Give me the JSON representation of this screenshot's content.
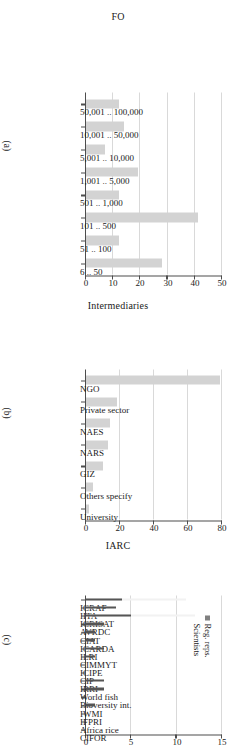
{
  "figure": {
    "orientation": "rotated-90",
    "panels": [
      "a",
      "b",
      "c"
    ]
  },
  "panel_a": {
    "tag": "(a)",
    "ylabel": "FO"
  },
  "panel_b": {
    "tag": "(b)",
    "ylabel": "Intermediaries"
  },
  "panel_c": {
    "tag": "(c)",
    "ylabel": "IARC",
    "legend": [
      {
        "label": "Reg. reps.",
        "color": "#808080"
      },
      {
        "label": "Scientists",
        "color": "#555555"
      }
    ]
  },
  "colors": {
    "bar_light": "#d3d3d3",
    "bar_dark": "#555555",
    "bar_reg_reps": "#f2f2f2",
    "grid": "#d9d9d9",
    "axis": "#4d4d4d",
    "text": "#1a1a1a"
  },
  "chart_data": [
    {
      "type": "bar",
      "id": "panel-a",
      "title": "(a)",
      "xlabel": "",
      "ylabel": "FO",
      "orientation": "vertical",
      "grid": true,
      "legend": null,
      "ylim": [
        0,
        50
      ],
      "yticks": [
        0,
        10,
        20,
        30,
        40,
        50
      ],
      "categories": [
        "50,001 .. 100,000",
        "10,001 .. 50,000",
        "5,001 .. 10,000",
        "1,001 .. 5,000",
        "501 .. 1,000",
        "101 .. 500",
        "51 .. 100",
        "6 .. 50"
      ],
      "values": [
        12,
        14,
        7,
        19,
        12,
        41,
        12,
        28
      ]
    },
    {
      "type": "bar",
      "id": "panel-b",
      "title": "(b)",
      "xlabel": "",
      "ylabel": "Intermediaries",
      "orientation": "vertical",
      "grid": true,
      "legend": null,
      "ylim": [
        0,
        80
      ],
      "yticks": [
        0,
        20,
        40,
        60,
        80
      ],
      "categories": [
        "NGO",
        "Private sector",
        "NAES",
        "NARS",
        "GIZ",
        "Others specify",
        "University"
      ],
      "values": [
        79,
        18,
        14,
        13,
        10,
        4,
        2
      ]
    },
    {
      "type": "bar",
      "id": "panel-c",
      "title": "(c)",
      "xlabel": "",
      "ylabel": "IARC",
      "orientation": "vertical",
      "grid": true,
      "ylim": [
        0,
        15
      ],
      "yticks": [
        0,
        5,
        10,
        15
      ],
      "legend": {
        "position": "right",
        "entries": [
          "Reg. reps.",
          "Scientists"
        ]
      },
      "categories": [
        "ICRAF",
        "IITA",
        "ICRISAT",
        "AVRDC",
        "CIAT",
        "ICARDA",
        "ILRI",
        "CIMMYT",
        "ICIPE",
        "CIP",
        "IRRI",
        "World fish",
        "Bioversity int.",
        "IWMI",
        "IFPRI",
        "Africa rice",
        "CIFOR"
      ],
      "series": [
        {
          "name": "Reg. reps.",
          "values": [
            11,
            1,
            12,
            1,
            0,
            0,
            0,
            0,
            0,
            0,
            0,
            0,
            0,
            0,
            0,
            0,
            0
          ]
        },
        {
          "name": "Scientists",
          "values": [
            4,
            3.3,
            5,
            2,
            1,
            1,
            2,
            1,
            0,
            0,
            2,
            2,
            0,
            1,
            0,
            0,
            0
          ]
        }
      ]
    }
  ]
}
